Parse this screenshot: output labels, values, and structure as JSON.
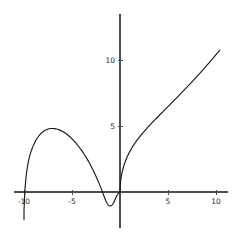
{
  "figure": {
    "title": "",
    "background_color": "#ffffff",
    "width": 237,
    "height": 238
  },
  "chart_data": {
    "type": "line",
    "title": "",
    "xlabel": "",
    "ylabel": "",
    "xlim": [
      -10.4,
      10.6
    ],
    "ylim": [
      -2.2,
      13.6
    ],
    "grid": false,
    "legend": null,
    "axis_color": "#4d4d4d",
    "curve_color": "#1a1a1a",
    "xticks": [
      -10,
      -5,
      5,
      10
    ],
    "xtick_labels": [
      "-10",
      "-5",
      "5",
      "10"
    ],
    "yticks": [
      5,
      10
    ],
    "ytick_labels": [
      "5",
      "10"
    ],
    "annotations": [],
    "series": [
      {
        "name": "left-branch",
        "comment": "arch rising from (-10,-2.1) through peak near (-6.2,4.8) down to a small loop dipping below the axis near x=-0.6, returning to the origin",
        "x": [
          -10.0,
          -10.0,
          -9.95,
          -9.9,
          -9.8,
          -9.7,
          -9.6,
          -9.5,
          -9.4,
          -9.3,
          -9.2,
          -9.1,
          -9.0,
          -8.8,
          -8.6,
          -8.4,
          -8.2,
          -8.0,
          -7.8,
          -7.6,
          -7.4,
          -7.2,
          -7.0,
          -6.8,
          -6.6,
          -6.4,
          -6.2,
          -6.0,
          -5.8,
          -5.6,
          -5.4,
          -5.2,
          -5.0,
          -4.8,
          -4.6,
          -4.4,
          -4.2,
          -4.0,
          -3.8,
          -3.6,
          -3.4,
          -3.2,
          -3.0,
          -2.8,
          -2.6,
          -2.4,
          -2.2,
          -2.0,
          -1.9,
          -1.8,
          -1.7,
          -1.6,
          -1.5,
          -1.4,
          -1.35,
          -1.3,
          -1.25,
          -1.2,
          -1.15,
          -1.1,
          -1.05,
          -1.0,
          -0.95,
          -0.9,
          -0.85,
          -0.8,
          -0.75,
          -0.7,
          -0.65,
          -0.6,
          -0.55,
          -0.5,
          -0.45,
          -0.4,
          -0.35,
          -0.3,
          -0.25,
          -0.2,
          -0.15,
          -0.1,
          -0.05,
          0.0
        ],
        "y": [
          -2.1,
          -1.4,
          -0.6,
          0.2,
          1.05,
          1.65,
          2.1,
          2.45,
          2.75,
          3.0,
          3.2,
          3.4,
          3.57,
          3.87,
          4.11,
          4.3,
          4.46,
          4.58,
          4.68,
          4.74,
          4.79,
          4.81,
          4.81,
          4.8,
          4.77,
          4.73,
          4.67,
          4.6,
          4.51,
          4.41,
          4.3,
          4.17,
          4.03,
          3.88,
          3.72,
          3.54,
          3.35,
          3.15,
          2.94,
          2.71,
          2.47,
          2.21,
          1.94,
          1.65,
          1.35,
          1.03,
          0.69,
          0.33,
          0.14,
          -0.05,
          -0.25,
          -0.44,
          -0.62,
          -0.78,
          -0.85,
          -0.91,
          -0.96,
          -1.0,
          -1.03,
          -1.05,
          -1.06,
          -1.06,
          -1.05,
          -1.03,
          -1.0,
          -0.96,
          -0.91,
          -0.85,
          -0.78,
          -0.71,
          -0.63,
          -0.55,
          -0.47,
          -0.39,
          -0.32,
          -0.25,
          -0.19,
          -0.13,
          -0.08,
          -0.04,
          -0.01,
          0.0
        ]
      },
      {
        "name": "right-branch",
        "comment": "steeply rising branch from the origin, concave down, reaching about y=13.2 at x=10.4",
        "x": [
          0.0,
          0.05,
          0.1,
          0.15,
          0.2,
          0.3,
          0.4,
          0.5,
          0.6,
          0.7,
          0.8,
          0.9,
          1.0,
          1.2,
          1.4,
          1.6,
          1.8,
          2.0,
          2.25,
          2.5,
          2.75,
          3.0,
          3.5,
          4.0,
          4.5,
          5.0,
          5.5,
          6.0,
          6.5,
          7.0,
          7.5,
          8.0,
          8.5,
          9.0,
          9.5,
          10.0,
          10.4
        ],
        "y": [
          0.0,
          0.72,
          1.02,
          1.24,
          1.43,
          1.74,
          1.99,
          2.21,
          2.4,
          2.58,
          2.74,
          2.89,
          3.04,
          3.3,
          3.53,
          3.75,
          3.95,
          4.14,
          4.37,
          4.58,
          4.79,
          4.99,
          5.37,
          5.74,
          6.11,
          6.47,
          6.84,
          7.21,
          7.58,
          7.96,
          8.35,
          8.74,
          9.14,
          9.55,
          9.97,
          10.4,
          10.75
        ]
      }
    ]
  },
  "axes_geometry": {
    "origin_px": [
      120,
      192
    ],
    "x_unit_px": 9.6,
    "y_unit_px": 13.2,
    "x_axis_span_px": [
      14,
      228
    ],
    "y_axis_span_px": [
      14,
      228
    ]
  }
}
